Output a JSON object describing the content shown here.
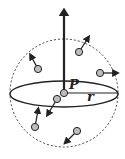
{
  "diagram": {
    "labels": {
      "center": "P",
      "radius": "r"
    },
    "sphere": {
      "cx": 64,
      "cy": 93,
      "r": 54,
      "style": "dashed"
    },
    "equator": {
      "cx": 64,
      "cy": 94,
      "rx": 54,
      "ry": 13
    },
    "vertical_arrow": {
      "x": 64,
      "y1": 93,
      "y2": 12
    },
    "radius_line": {
      "x1": 64,
      "y1": 93,
      "x2": 118,
      "y2": 93
    },
    "particles": [
      {
        "x": 79,
        "y": 52,
        "ax": 88,
        "ay": 38
      },
      {
        "x": 38,
        "y": 69,
        "ax": 31,
        "ay": 56
      },
      {
        "x": 100,
        "y": 73,
        "ax": 116,
        "ay": 73
      },
      {
        "x": 57,
        "y": 99,
        "ax": 48,
        "ay": 114
      },
      {
        "x": 35,
        "y": 127,
        "ax": 38,
        "ay": 110
      },
      {
        "x": 77,
        "y": 131,
        "ax": 66,
        "ay": 142
      }
    ],
    "colors": {
      "stroke": "#222222",
      "particle_fill": "#bdbdbd",
      "dash": "#444444"
    }
  }
}
